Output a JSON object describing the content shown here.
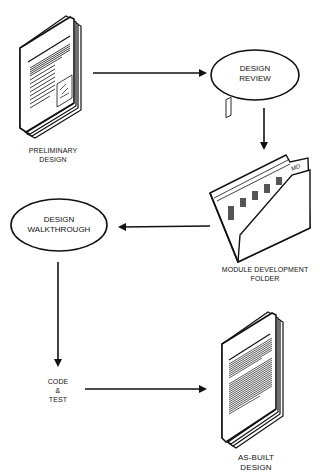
{
  "diagram": {
    "nodes": [
      {
        "id": "preliminary_design",
        "shape": "document-stack",
        "lines": [
          "PRELIMINARY",
          "DESIGN"
        ]
      },
      {
        "id": "design_review",
        "shape": "ellipse",
        "lines": [
          "DESIGN",
          "REVIEW"
        ]
      },
      {
        "id": "module_development_folder",
        "shape": "folder",
        "lines": [
          "MODULE DEVELOPMENT",
          "FOLDER"
        ],
        "tab_label": "MD"
      },
      {
        "id": "design_walkthrough",
        "shape": "ellipse",
        "lines": [
          "DESIGN",
          "WALKTHROUGH"
        ]
      },
      {
        "id": "code_test",
        "shape": "text",
        "lines": [
          "CODE",
          "&",
          "TEST"
        ]
      },
      {
        "id": "as_built_design",
        "shape": "document-stack",
        "lines": [
          "AS-BUILT",
          "DESIGN"
        ]
      }
    ],
    "edges": [
      {
        "from": "preliminary_design",
        "to": "design_review"
      },
      {
        "from": "design_review",
        "to": "module_development_folder"
      },
      {
        "from": "module_development_folder",
        "to": "design_walkthrough"
      },
      {
        "from": "design_walkthrough",
        "to": "code_test"
      },
      {
        "from": "code_test",
        "to": "as_built_design"
      }
    ],
    "colors": {
      "stroke": "#111111",
      "background": "#ffffff"
    }
  }
}
